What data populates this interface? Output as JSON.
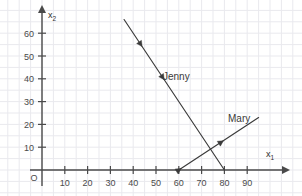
{
  "chart_data": {
    "type": "line",
    "title": "",
    "xlabel": "x₁",
    "ylabel": "x₂",
    "xlim": [
      0,
      100
    ],
    "ylim": [
      0,
      68
    ],
    "grid": true,
    "grid_step": 5,
    "legend": "inline-labels",
    "x_ticks": [
      10,
      20,
      30,
      40,
      50,
      60,
      70,
      80,
      90
    ],
    "y_ticks": [
      10,
      20,
      30,
      40,
      50,
      60
    ],
    "origin_label": "O",
    "series": [
      {
        "name": "Jenny",
        "label": "Jenny",
        "points": [
          [
            36,
            66
          ],
          [
            40,
            60
          ],
          [
            50,
            45
          ],
          [
            80,
            0
          ]
        ],
        "slope": -1.5,
        "x_intercept": 80,
        "arrow_markers": 2,
        "arrow_direction": "down-right",
        "color": "#3a3a3a"
      },
      {
        "name": "Mary",
        "label": "Mary",
        "points": [
          [
            60,
            0
          ],
          [
            78,
            9
          ],
          [
            95,
            23
          ]
        ],
        "slope": 0.64,
        "x_intercept": 60,
        "arrow_markers": 2,
        "arrow_direction": "up-right",
        "color": "#3a3a3a"
      }
    ],
    "intersection": [
      78,
      9
    ],
    "colors": {
      "grid": "#e9e9ee",
      "axis": "#4a4a4a",
      "line": "#3a3a3a",
      "text": "#3a3a3a",
      "background": "#ffffff"
    }
  },
  "axes": {
    "x_title": "x",
    "x_sub": "1",
    "y_title": "x",
    "y_sub": "2"
  },
  "labels": {
    "origin": "O",
    "jenny": "Jenny",
    "mary": "Mary"
  }
}
